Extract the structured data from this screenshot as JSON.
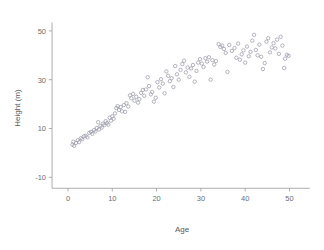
{
  "chart_data": {
    "type": "scatter",
    "title": "",
    "xlabel": "Age",
    "ylabel": "Height (m)",
    "xlim": [
      -3,
      53
    ],
    "ylim": [
      -14,
      53
    ],
    "grid": false,
    "legend": null,
    "marker": {
      "shape": "open-circle",
      "color": "#9b9bab",
      "size_px": 3.4,
      "fill": "none"
    },
    "xticks": [
      0,
      10,
      20,
      30,
      40,
      50
    ],
    "yticks": [
      -10,
      10,
      30,
      50
    ],
    "xtick_labels": [
      "0",
      "10",
      "20",
      "30",
      "40",
      "50"
    ],
    "ytick_labels": [
      "-10",
      "10",
      "30",
      "50"
    ],
    "points": [
      [
        1.0,
        3.4
      ],
      [
        1.2,
        4.6
      ],
      [
        1.4,
        2.9
      ],
      [
        1.8,
        4.1
      ],
      [
        2.2,
        5.2
      ],
      [
        2.5,
        4.4
      ],
      [
        2.9,
        6.0
      ],
      [
        3.2,
        5.6
      ],
      [
        3.6,
        6.8
      ],
      [
        4.0,
        7.0
      ],
      [
        4.4,
        6.4
      ],
      [
        4.8,
        8.2
      ],
      [
        5.2,
        8.6
      ],
      [
        5.5,
        7.8
      ],
      [
        5.9,
        9.4
      ],
      [
        6.2,
        8.8
      ],
      [
        6.5,
        10.2
      ],
      [
        6.8,
        12.6
      ],
      [
        7.0,
        9.6
      ],
      [
        7.3,
        11.0
      ],
      [
        7.6,
        10.4
      ],
      [
        7.9,
        12.0
      ],
      [
        8.2,
        11.4
      ],
      [
        8.5,
        13.0
      ],
      [
        8.8,
        12.2
      ],
      [
        9.1,
        11.6
      ],
      [
        9.4,
        14.4
      ],
      [
        9.7,
        13.2
      ],
      [
        10.0,
        15.0
      ],
      [
        10.3,
        14.0
      ],
      [
        10.6,
        16.2
      ],
      [
        10.9,
        18.4
      ],
      [
        11.2,
        19.2
      ],
      [
        11.5,
        17.6
      ],
      [
        11.9,
        18.8
      ],
      [
        12.2,
        17.0
      ],
      [
        12.6,
        19.6
      ],
      [
        12.9,
        16.8
      ],
      [
        13.2,
        20.4
      ],
      [
        13.6,
        19.0
      ],
      [
        14.0,
        23.6
      ],
      [
        14.3,
        22.4
      ],
      [
        14.7,
        24.2
      ],
      [
        15.0,
        21.4
      ],
      [
        15.4,
        23.0
      ],
      [
        15.8,
        20.6
      ],
      [
        16.1,
        22.0
      ],
      [
        16.5,
        24.6
      ],
      [
        16.9,
        25.8
      ],
      [
        17.2,
        23.4
      ],
      [
        17.6,
        26.0
      ],
      [
        18.0,
        31.0
      ],
      [
        18.3,
        27.4
      ],
      [
        18.7,
        24.0
      ],
      [
        19.0,
        25.0
      ],
      [
        19.4,
        21.0
      ],
      [
        19.8,
        22.6
      ],
      [
        20.2,
        29.0
      ],
      [
        20.6,
        26.8
      ],
      [
        21.0,
        30.2
      ],
      [
        21.4,
        28.4
      ],
      [
        21.8,
        24.4
      ],
      [
        22.2,
        33.4
      ],
      [
        22.6,
        31.6
      ],
      [
        23.0,
        29.4
      ],
      [
        23.4,
        30.6
      ],
      [
        23.8,
        27.0
      ],
      [
        24.2,
        35.6
      ],
      [
        24.6,
        32.2
      ],
      [
        25.0,
        30.0
      ],
      [
        25.4,
        34.0
      ],
      [
        25.8,
        36.4
      ],
      [
        26.2,
        37.8
      ],
      [
        26.6,
        33.0
      ],
      [
        27.0,
        35.0
      ],
      [
        27.4,
        31.2
      ],
      [
        27.8,
        34.6
      ],
      [
        28.2,
        36.0
      ],
      [
        28.6,
        29.2
      ],
      [
        29.0,
        33.6
      ],
      [
        29.4,
        37.0
      ],
      [
        29.8,
        38.4
      ],
      [
        30.2,
        36.6
      ],
      [
        30.6,
        35.2
      ],
      [
        31.0,
        38.8
      ],
      [
        31.4,
        37.4
      ],
      [
        31.8,
        39.2
      ],
      [
        32.2,
        30.0
      ],
      [
        32.6,
        38.0
      ],
      [
        33.0,
        36.2
      ],
      [
        33.4,
        37.6
      ],
      [
        34.0,
        44.6
      ],
      [
        34.4,
        43.4
      ],
      [
        34.8,
        44.0
      ],
      [
        35.2,
        42.6
      ],
      [
        35.6,
        41.0
      ],
      [
        36.0,
        33.2
      ],
      [
        36.4,
        44.2
      ],
      [
        37.0,
        41.8
      ],
      [
        37.6,
        43.0
      ],
      [
        38.0,
        39.0
      ],
      [
        38.4,
        44.8
      ],
      [
        38.8,
        38.2
      ],
      [
        39.2,
        40.4
      ],
      [
        39.6,
        42.0
      ],
      [
        40.0,
        37.0
      ],
      [
        40.4,
        43.6
      ],
      [
        40.8,
        39.6
      ],
      [
        41.2,
        41.4
      ],
      [
        41.6,
        46.0
      ],
      [
        42.0,
        48.4
      ],
      [
        42.4,
        42.2
      ],
      [
        42.8,
        40.0
      ],
      [
        43.2,
        44.4
      ],
      [
        43.6,
        39.4
      ],
      [
        44.0,
        34.4
      ],
      [
        44.4,
        36.8
      ],
      [
        44.8,
        45.6
      ],
      [
        45.2,
        47.0
      ],
      [
        45.6,
        41.2
      ],
      [
        46.0,
        43.2
      ],
      [
        46.4,
        45.0
      ],
      [
        46.8,
        42.8
      ],
      [
        47.2,
        46.4
      ],
      [
        47.6,
        40.6
      ],
      [
        48.0,
        47.6
      ],
      [
        48.4,
        44.0
      ],
      [
        48.8,
        34.8
      ],
      [
        49.0,
        38.6
      ],
      [
        49.4,
        40.2
      ],
      [
        49.8,
        39.8
      ]
    ]
  }
}
